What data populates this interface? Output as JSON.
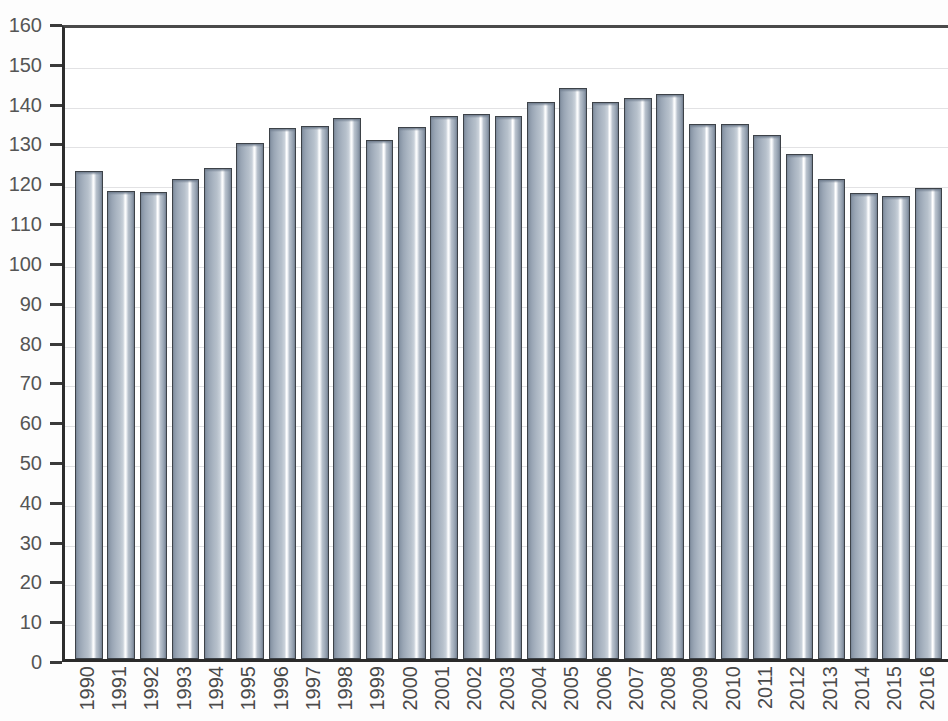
{
  "chart_data": {
    "type": "bar",
    "title": "",
    "subtitle": "",
    "xlabel": "",
    "ylabel": "",
    "ylim": [
      0,
      160
    ],
    "ytick_step": 10,
    "yticks": [
      0,
      10,
      20,
      30,
      40,
      50,
      60,
      70,
      80,
      90,
      100,
      110,
      120,
      130,
      140,
      150,
      160
    ],
    "ytick_labels": [
      "0",
      "10",
      "20",
      "30",
      "40",
      "50",
      "60",
      "70",
      "80",
      "90",
      "100",
      "110",
      "120",
      "130",
      "140",
      "150",
      "160"
    ],
    "grid": true,
    "legend": null,
    "legend_position": "none",
    "bar_color": "#aab5c2",
    "bar_edge_color": "#3d4248",
    "grid_color": "#e2e2e4",
    "axis_color": "#2e2e2e",
    "text_color": "#4a4a4a",
    "categories": [
      "1990",
      "1991",
      "1992",
      "1993",
      "1994",
      "1995",
      "1996",
      "1997",
      "1998",
      "1999",
      "2000",
      "2001",
      "2002",
      "2003",
      "2004",
      "2005",
      "2006",
      "2007",
      "2008",
      "2009",
      "2010",
      "2011",
      "2012",
      "2013",
      "2014",
      "2015",
      "2016"
    ],
    "values": [
      122.5,
      117.5,
      117.2,
      120.6,
      123.3,
      129.6,
      133.3,
      133.8,
      136.0,
      130.4,
      133.7,
      136.4,
      136.9,
      136.4,
      140.0,
      143.4,
      140.0,
      140.8,
      142.0,
      134.5,
      134.5,
      131.5,
      126.8,
      120.6,
      117.0,
      116.3,
      118.2
    ]
  }
}
